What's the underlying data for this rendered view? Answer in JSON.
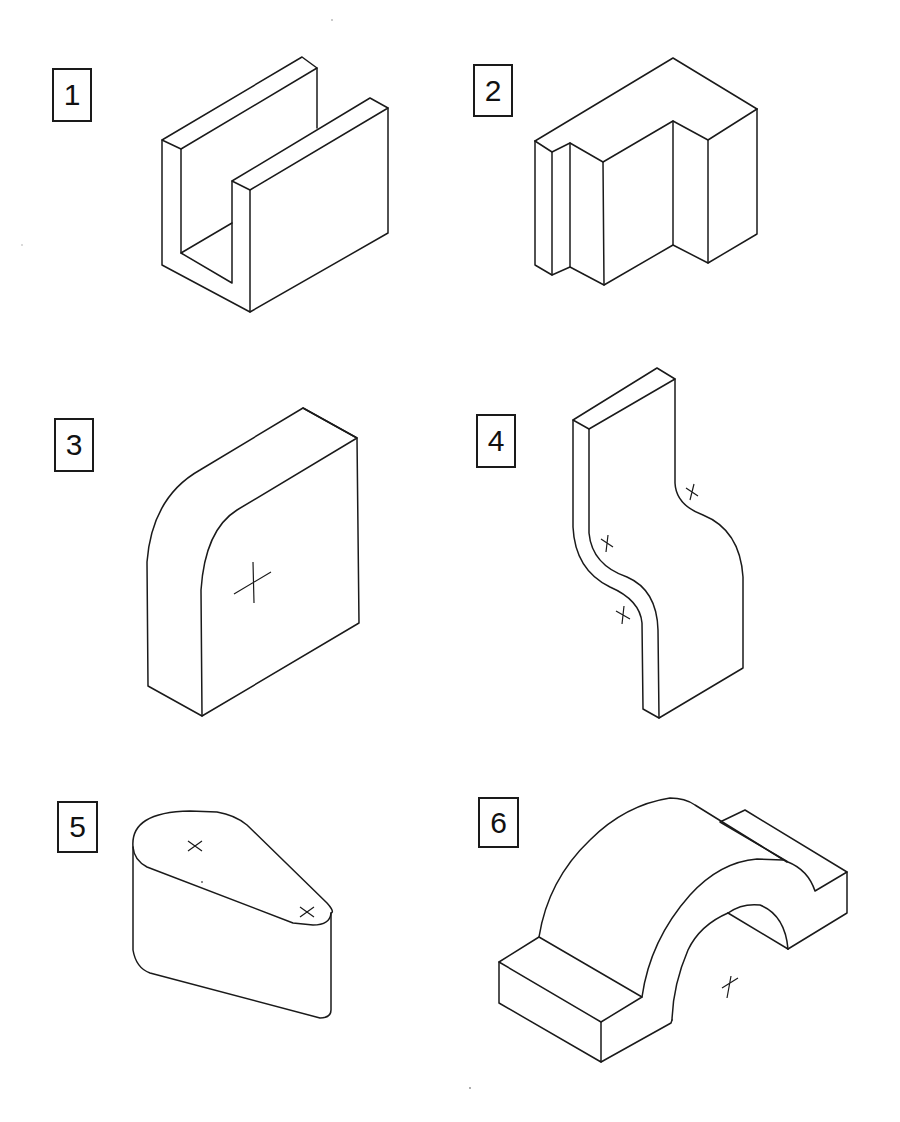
{
  "figure": {
    "type": "isometric-drawing-exercise",
    "line_color": "#1a1a1a",
    "background": "#ffffff"
  },
  "shapes": [
    {
      "label": "1",
      "description": "U-channel block (two parallel walls on a base)"
    },
    {
      "label": "2",
      "description": "Stepped L-shaped block with grooved left face"
    },
    {
      "label": "3",
      "description": "Square slab with one rounded (filleted) top corner, center mark"
    },
    {
      "label": "4",
      "description": "S-curved vertical plate with three center marks"
    },
    {
      "label": "5",
      "description": "Teardrop/cam-shaped extruded prism with two center marks"
    },
    {
      "label": "6",
      "description": "Arched bridge block with end pads and center mark"
    }
  ]
}
